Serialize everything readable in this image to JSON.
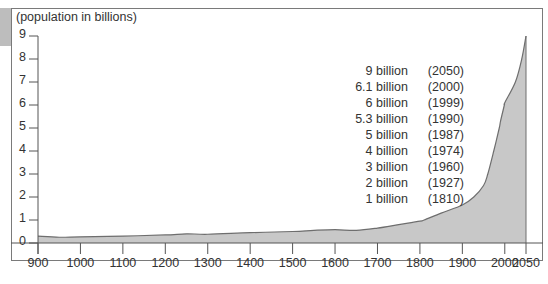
{
  "chart_data": {
    "type": "area",
    "title": "",
    "ylabel": "(population in billions)",
    "xlabel": "",
    "xlim": [
      900,
      2050
    ],
    "ylim": [
      0,
      9
    ],
    "x_ticks": [
      "900",
      "1000",
      "1100",
      "1200",
      "1300",
      "1400",
      "1500",
      "1600",
      "1700",
      "1800",
      "1900",
      "2000",
      "2050"
    ],
    "y_ticks": [
      "0",
      "1",
      "2",
      "3",
      "4",
      "5",
      "6",
      "7",
      "8",
      "9"
    ],
    "grid": false,
    "series": [
      {
        "name": "World population",
        "x": [
          900,
          950,
          1000,
          1100,
          1200,
          1250,
          1300,
          1400,
          1500,
          1550,
          1600,
          1650,
          1700,
          1750,
          1800,
          1810,
          1850,
          1900,
          1927,
          1950,
          1960,
          1974,
          1987,
          1990,
          1999,
          2000,
          2025,
          2040,
          2050
        ],
        "values": [
          0.3,
          0.25,
          0.27,
          0.3,
          0.35,
          0.4,
          0.38,
          0.45,
          0.5,
          0.55,
          0.58,
          0.55,
          0.65,
          0.8,
          0.95,
          1.0,
          1.3,
          1.65,
          2.0,
          2.5,
          3.0,
          4.0,
          5.0,
          5.3,
          6.0,
          6.1,
          7.0,
          8.0,
          9.0
        ]
      }
    ],
    "annotations": [
      {
        "value": "9 billion",
        "year": "(2050)"
      },
      {
        "value": "6.1 billion",
        "year": "(2000)"
      },
      {
        "value": "6 billion",
        "year": "(1999)"
      },
      {
        "value": "5.3 billion",
        "year": "(1990)"
      },
      {
        "value": "5 billion",
        "year": "(1987)"
      },
      {
        "value": "4 billion",
        "year": "(1974)"
      },
      {
        "value": "3 billion",
        "year": "(1960)"
      },
      {
        "value": "2 billion",
        "year": "(1927)"
      },
      {
        "value": "1 billion",
        "year": "(1810)"
      }
    ],
    "colors": {
      "fill": "#c8c8c8",
      "line": "#6e6e6e",
      "axis": "#555555",
      "frame": "#7a7a7a"
    }
  }
}
